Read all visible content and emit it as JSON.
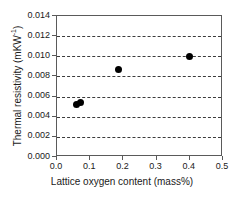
{
  "chart_data": {
    "type": "scatter",
    "title": "",
    "xlabel": "Lattice oxygen content (mass%)",
    "ylabel_text": "Thermal resistivity (mKW",
    "ylabel_sup": "-1",
    "ylabel_tail": ")",
    "ylabel_full": "Thermal resistivity (mKW-1)",
    "xlim": [
      0.0,
      0.5
    ],
    "ylim": [
      0.0,
      0.014
    ],
    "xticks": [
      0.0,
      0.1,
      0.2,
      0.3,
      0.4,
      0.5
    ],
    "xticklabels": [
      "0.0",
      "0.1",
      "0.2",
      "0.3",
      "0.4",
      "0.5"
    ],
    "yticks": [
      0.0,
      0.002,
      0.004,
      0.006,
      0.008,
      0.01,
      0.012,
      0.014
    ],
    "yticklabels": [
      "0.000",
      "0.002",
      "0.004",
      "0.006",
      "0.008",
      "0.010",
      "0.012",
      "0.014"
    ],
    "grid": {
      "horizontal": true,
      "vertical": false,
      "style": "dashed",
      "color": "#3c3c3c"
    },
    "legend": null,
    "series": [
      {
        "name": "Thermal resistivity",
        "marker": "filled-circle",
        "color": "#000000",
        "points": [
          {
            "x": 0.06,
            "y": 0.00522
          },
          {
            "x": 0.07,
            "y": 0.00538
          },
          {
            "x": 0.185,
            "y": 0.00868
          },
          {
            "x": 0.398,
            "y": 0.00996
          }
        ]
      }
    ],
    "colors": {
      "marker": "#000000",
      "axis": "#5a5a5a",
      "grid": "#3c3c3c",
      "text": "#1a1a1a",
      "background": "#ffffff"
    }
  }
}
